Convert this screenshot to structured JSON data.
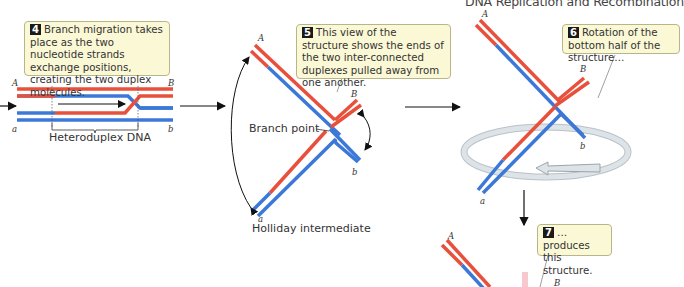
{
  "header": {
    "title": "DNA Replication and Recombination"
  },
  "steps": [
    {
      "number": "4",
      "text": "Branch migration takes place as the two nucleotide strands exchange positions, creating the two duplex molecules.",
      "label": "Heteroduplex DNA",
      "ends": {
        "top_left": "A",
        "top_right": "B",
        "bottom_left": "a",
        "bottom_right": "b"
      }
    },
    {
      "number": "5",
      "text": "This view of the structure shows the ends of the two inter-connected duplexes pulled away from one another.",
      "labels": {
        "branch_point": "Branch point",
        "caption": "Holliday intermediate"
      },
      "ends": {
        "A": "A",
        "B": "B",
        "a": "a",
        "b": "b"
      }
    },
    {
      "number": "6",
      "text": "Rotation of the bottom half of the structure…",
      "ends": {
        "A": "A",
        "B": "B",
        "a": "a",
        "b": "b"
      }
    },
    {
      "number": "7",
      "text": "…produces this structure.",
      "ends": {
        "A": "A",
        "B": "B"
      }
    }
  ],
  "colors": {
    "red_strand": "#e8503c",
    "blue_strand": "#3c78d8",
    "callout_bg": "#fbf8d6",
    "rotation_ring": "#c8d0d6"
  }
}
